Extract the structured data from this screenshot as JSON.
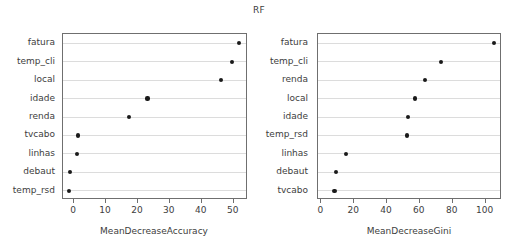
{
  "figure": {
    "title": "RF",
    "background_color": "#ffffff",
    "text_color": "#3d3d3d",
    "point_color": "#1a1a1a",
    "grid_color": "#dcdcdc",
    "box_color": "#6f6f6f"
  },
  "chart_data": [
    {
      "type": "scatter",
      "title": "RF",
      "panel": "left",
      "xlabel": "MeanDecreaseAccuracy",
      "ylabel": "",
      "orientation": "horizontal-dotplot",
      "grid": true,
      "legend": "none",
      "xlim": [
        -3.5,
        54.5
      ],
      "xticks": [
        0,
        10,
        20,
        30,
        40,
        50
      ],
      "xtick_labels": [
        "0",
        "10",
        "20",
        "30",
        "40",
        "50"
      ],
      "categories": [
        "fatura",
        "temp_cli",
        "local",
        "idade",
        "renda",
        "tvcabo",
        "linhas",
        "debaut",
        "temp_rsd"
      ],
      "values": [
        51.6,
        49.4,
        46.0,
        23.0,
        17.2,
        1.2,
        0.9,
        -1.2,
        -1.5
      ]
    },
    {
      "type": "scatter",
      "title": "RF",
      "panel": "right",
      "xlabel": "MeanDecreaseGini",
      "ylabel": "",
      "orientation": "horizontal-dotplot",
      "grid": true,
      "legend": "none",
      "xlim": [
        -2,
        110
      ],
      "xticks": [
        0,
        20,
        40,
        60,
        80,
        100
      ],
      "xtick_labels": [
        "0",
        "20",
        "40",
        "60",
        "80",
        "100"
      ],
      "categories": [
        "fatura",
        "temp_cli",
        "renda",
        "local",
        "idade",
        "temp_rsd",
        "linhas",
        "debaut",
        "tvcabo"
      ],
      "values": [
        105.0,
        73.0,
        63.0,
        57.0,
        53.0,
        52.0,
        15.0,
        9.0,
        8.0
      ]
    }
  ]
}
